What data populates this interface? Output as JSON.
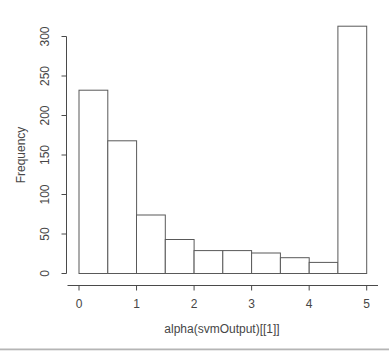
{
  "window": {
    "background": "#ffffff",
    "divider_color": "#b5b5b5"
  },
  "chart_data": {
    "type": "bar",
    "subtype": "histogram",
    "title": "",
    "xlabel": "alpha(svmOutput)[[1]]",
    "ylabel": "Frequency",
    "bin_edges": [
      0,
      0.5,
      1,
      1.5,
      2,
      2.5,
      3,
      3.5,
      4,
      4.5,
      5
    ],
    "counts": [
      232,
      168,
      74,
      43,
      29,
      29,
      26,
      20,
      14,
      313
    ],
    "x_ticks": [
      "0",
      "1",
      "2",
      "3",
      "4",
      "5"
    ],
    "y_ticks": [
      "0",
      "50",
      "100",
      "150",
      "200",
      "250",
      "300"
    ],
    "xlim": [
      0,
      5
    ],
    "ylim": [
      0,
      300
    ],
    "grid": false,
    "legend": "none",
    "bar_fill": "#ffffff",
    "bar_stroke": "#595959",
    "axis_color": "#4a4a4a",
    "text_color": "#464646"
  }
}
